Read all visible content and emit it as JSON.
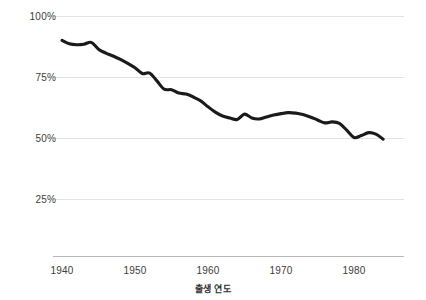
{
  "chart_data": {
    "type": "line",
    "title": "",
    "subtitle": "",
    "xlabel": "출생 연도",
    "ylabel": "",
    "xlim": [
      1940,
      1984
    ],
    "ylim": [
      0,
      100
    ],
    "grid": true,
    "legend": "none",
    "x_ticks": [
      "1940",
      "1950",
      "1960",
      "1970",
      "1980"
    ],
    "x_tick_values": [
      1940,
      1950,
      1960,
      1970,
      1980
    ],
    "y_ticks": [
      "25%",
      "50%",
      "75%",
      "100%"
    ],
    "y_tick_values": [
      25,
      50,
      75,
      100
    ],
    "series": [
      {
        "name": "",
        "color": "#1a1a1a",
        "x": [
          1940,
          1941,
          1942,
          1943,
          1944,
          1945,
          1946,
          1947,
          1948,
          1949,
          1950,
          1951,
          1952,
          1953,
          1954,
          1955,
          1956,
          1957,
          1958,
          1959,
          1960,
          1961,
          1962,
          1963,
          1964,
          1965,
          1966,
          1967,
          1968,
          1969,
          1970,
          1971,
          1972,
          1973,
          1974,
          1975,
          1976,
          1977,
          1978,
          1979,
          1980,
          1981,
          1982,
          1983,
          1984
        ],
        "values": [
          90.0,
          88.6,
          88.2,
          88.4,
          89.2,
          86.4,
          84.8,
          83.6,
          82.2,
          80.6,
          78.8,
          76.4,
          76.6,
          73.4,
          70.0,
          69.8,
          68.4,
          68.0,
          66.8,
          65.2,
          62.8,
          60.6,
          59.0,
          58.2,
          57.6,
          59.8,
          58.2,
          57.8,
          58.6,
          59.4,
          60.0,
          60.4,
          60.2,
          59.6,
          58.6,
          57.4,
          56.2,
          56.6,
          56.0,
          53.2,
          50.2,
          51.0,
          52.2,
          51.6,
          49.5
        ]
      }
    ]
  },
  "axes": {
    "y_labels": [
      "100%",
      "75%",
      "50%",
      "25%"
    ],
    "x_labels": [
      "1940",
      "1950",
      "1960",
      "1970",
      "1980"
    ],
    "x_title": "출생 연도"
  },
  "colors": {
    "line": "#1a1a1a",
    "grid": "#e3e3e3",
    "axis": "#b9b9b9",
    "text": "#3c3c3c",
    "background": "#ffffff"
  }
}
